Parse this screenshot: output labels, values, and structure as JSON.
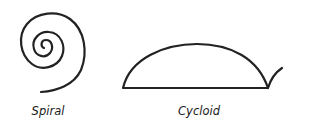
{
  "figures": [
    {
      "name": "spiral",
      "label": "Spiral",
      "label_x": 48,
      "label_y": 104
    },
    {
      "name": "cycloid",
      "label": "Cycloid",
      "label_x": 199,
      "label_y": 104
    }
  ],
  "stroke_color": "#222222"
}
